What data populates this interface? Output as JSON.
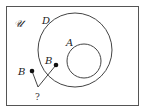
{
  "diagram": {
    "type": "venn",
    "universe_label": "𝒰",
    "sets": [
      {
        "id": "D",
        "label": "D"
      },
      {
        "id": "A",
        "label": "A"
      }
    ],
    "points": [
      {
        "id": "B-outside",
        "label": "B"
      },
      {
        "id": "B-inside",
        "label": "B"
      }
    ],
    "question_label": "?",
    "colors": {
      "stroke": "#444444",
      "point": "#111111",
      "background": "#ffffff"
    }
  }
}
